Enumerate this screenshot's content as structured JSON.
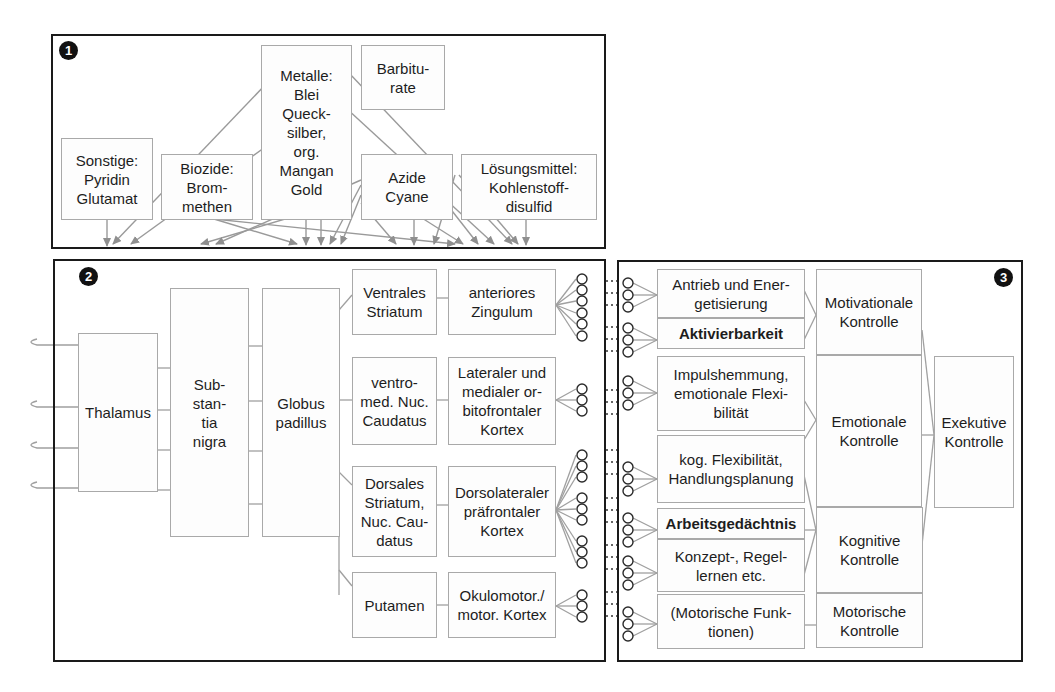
{
  "panel1": {
    "badge": "1",
    "boxes": {
      "sonstige": "Sonstige:\nPyridin\nGlutamat",
      "biozide": "Biozide:\nBrom-\nmethen",
      "metalle": "Metalle:\nBlei\nQueck-\nsilber,\norg.\nMangan\nGold",
      "barbiturate": "Barbitu-\nrate",
      "azide": "Azide\nCyane",
      "loesungsmittel": "Lösungsmittel:\nKohlenstoff-\ndisulfid"
    }
  },
  "panel2": {
    "badge": "2",
    "boxes": {
      "thalamus": "Thalamus",
      "substantia": "Sub-\nstan-\ntia\nnigra",
      "globus": "Globus\npadillus",
      "ventrales": "Ventrales\nStriatum",
      "ventromed": "ventro-\nmed. Nuc.\nCaudatus",
      "dorsales": "Dorsales\nStriatum,\nNuc. Cau-\ndatus",
      "putamen": "Putamen",
      "anteriores": "anteriores\nZingulum",
      "orbitofrontal": "Lateraler und\nmedialer or-\nbitofrontaler\nKortex",
      "dorsolateral": "Dorsolateraler\npräfrontaler\nKortex",
      "okulomotor": "Okulomotor./\nmotor. Kortex"
    }
  },
  "panel3": {
    "badge": "3",
    "functions": {
      "antrieb": "Antrieb und Ener-\ngetisierung",
      "aktivierbarkeit": "Aktivierbarkeit",
      "impuls": "Impulshemmung,\nemotionale Flexi-\nbilität",
      "kog": "kog. Flexibilität,\nHandlungsplanung",
      "arbeits": "Arbeitsgedächtnis",
      "konzept": "Konzept-, Regel-\nlernen etc.",
      "motorisch": "(Motorische Funk-\ntionen)"
    },
    "controls": {
      "motivationale": "Motivationale\nKontrolle",
      "emotionale": "Emotionale\nKontrolle",
      "kognitive": "Kognitive\nKontrolle",
      "motorische": "Motorische\nKontrolle",
      "exekutive": "Exekutive\nKontrolle"
    }
  },
  "colors": {
    "border": "#1a1a1a",
    "box_border": "#a9a9a9",
    "wire": "#9a9a9a"
  }
}
